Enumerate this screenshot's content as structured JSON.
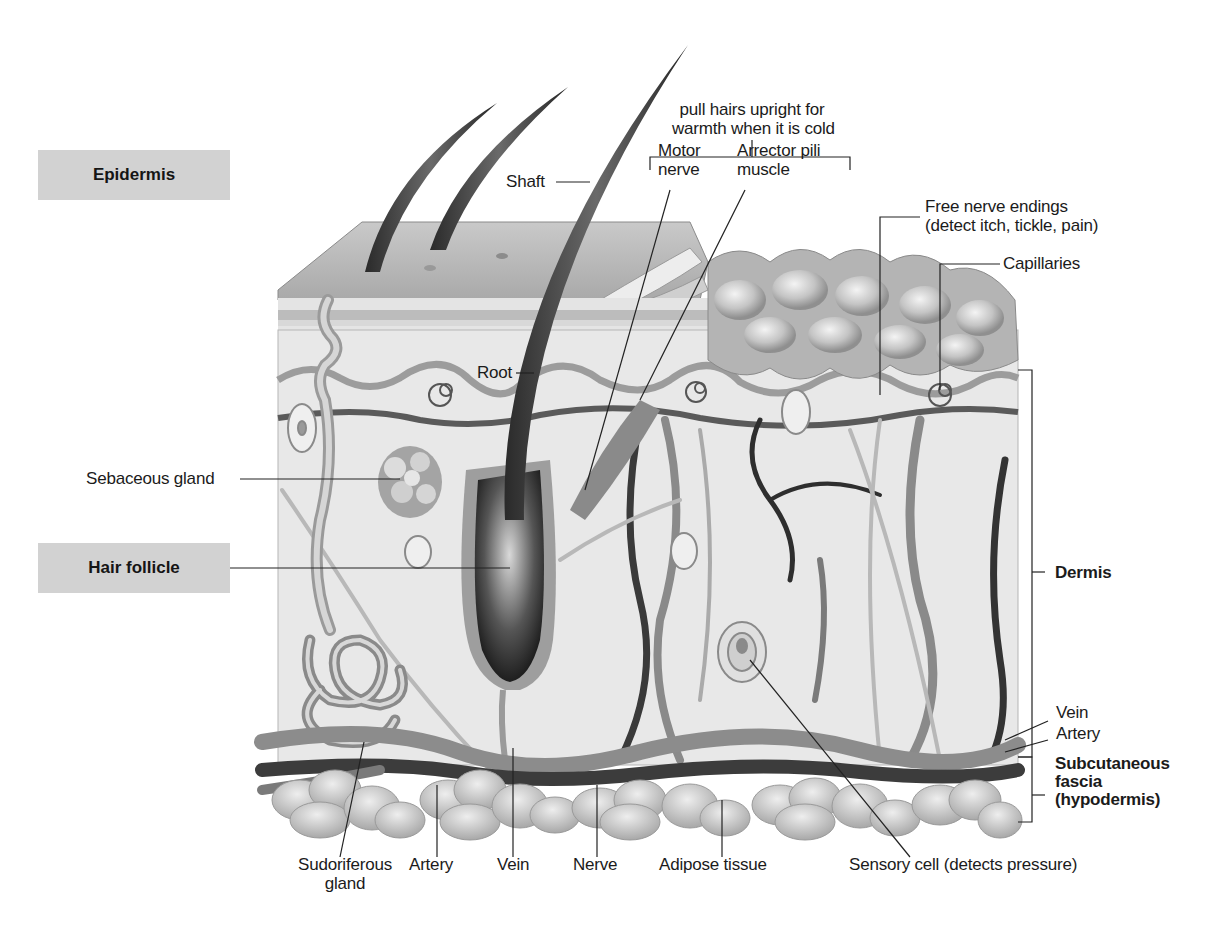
{
  "diagram": {
    "colors": {
      "background": "#ffffff",
      "label_box": "#d2d2d2",
      "skin_surface": "#bdbdbd",
      "dermis_fill": "#e6e6e6",
      "vessel_dark": "#3c3c3c",
      "vessel_mid": "#7a7a7a",
      "fat": "#c8c8c8",
      "leader_line": "#222222"
    },
    "layer_boxes": {
      "epidermis": "Epidermis",
      "hair_follicle": "Hair follicle"
    },
    "layer_brackets": {
      "dermis": "Dermis",
      "subcutaneous_line1": "Subcutaneous",
      "subcutaneous_line2": "fascia",
      "subcutaneous_line3": "(hypodermis)"
    },
    "top_note": {
      "line1": "pull hairs upright for",
      "line2": "warmth when it is cold"
    },
    "labels": {
      "shaft": "Shaft",
      "root": "Root",
      "motor_nerve_line1": "Motor",
      "motor_nerve_line2": "nerve",
      "arrector_line1": "Arrector pili",
      "arrector_line2": "muscle",
      "free_nerve_line1": "Free nerve endings",
      "free_nerve_line2": "(detect itch, tickle, pain)",
      "capillaries": "Capillaries",
      "sebaceous_gland": "Sebaceous gland",
      "vein_right": "Vein",
      "artery_right": "Artery"
    },
    "bottom_labels": {
      "sudoriferous_line1": "Sudoriferous",
      "sudoriferous_line2": "gland",
      "artery": "Artery",
      "vein": "Vein",
      "nerve": "Nerve",
      "adipose": "Adipose tissue",
      "sensory": "Sensory cell (detects pressure)"
    }
  }
}
